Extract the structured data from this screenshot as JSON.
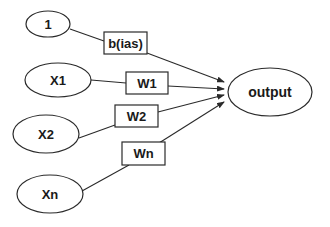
{
  "diagram": {
    "type": "perceptron",
    "colors": {
      "stroke": "#2a2a2a",
      "text": "#1a1a1a",
      "background": "#ffffff"
    },
    "inputs": [
      {
        "id": "bias-input",
        "label": "1"
      },
      {
        "id": "x1",
        "label": "X1"
      },
      {
        "id": "x2",
        "label": "X2"
      },
      {
        "id": "xn",
        "label": "Xn"
      }
    ],
    "weights": [
      {
        "id": "bias-weight",
        "label": "b(ias)"
      },
      {
        "id": "w1",
        "label": "W1"
      },
      {
        "id": "w2",
        "label": "W2"
      },
      {
        "id": "wn",
        "label": "Wn"
      }
    ],
    "output": {
      "label": "output"
    },
    "edges": [
      {
        "from": "1",
        "via": "b(ias)",
        "to": "output"
      },
      {
        "from": "X1",
        "via": "W1",
        "to": "output"
      },
      {
        "from": "X2",
        "via": "W2",
        "to": "output"
      },
      {
        "from": "Xn",
        "via": "Wn",
        "to": "output"
      }
    ]
  }
}
